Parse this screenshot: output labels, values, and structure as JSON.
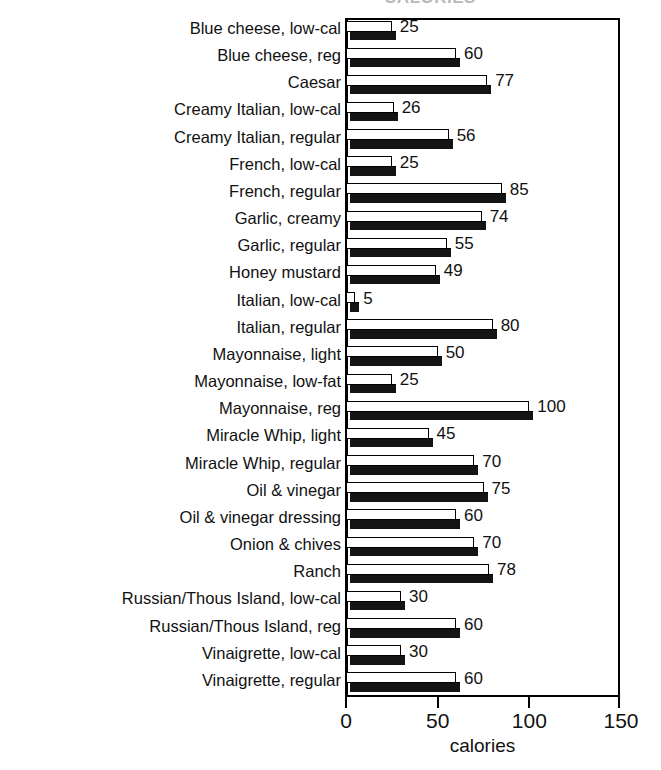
{
  "chart_data": {
    "type": "bar",
    "orientation": "horizontal",
    "title": "CALORIES",
    "subtitle": "",
    "xlabel": "calories",
    "ylabel": "",
    "xlim": [
      0,
      150
    ],
    "xticks": [
      0,
      50,
      100,
      150
    ],
    "xtick_labels": [
      "0",
      "50",
      "100",
      "150"
    ],
    "grid": false,
    "legend": null,
    "bar_style": "white-face-with-black-3d-shadow",
    "value_labels_shown": true,
    "categories": [
      "Blue cheese, low-cal",
      "Blue cheese, reg",
      "Caesar",
      "Creamy Italian, low-cal",
      "Creamy Italian, regular",
      "French, low-cal",
      "French, regular",
      "Garlic, creamy",
      "Garlic, regular",
      "Honey mustard",
      "Italian, low-cal",
      "Italian, regular",
      "Mayonnaise, light",
      "Mayonnaise, low-fat",
      "Mayonnaise, reg",
      "Miracle Whip, light",
      "Miracle Whip, regular",
      "Oil & vinegar",
      "Oil & vinegar dressing",
      "Onion & chives",
      "Ranch",
      "Russian/Thous Island, low-cal",
      "Russian/Thous Island, reg",
      "Vinaigrette, low-cal",
      "Vinaigrette, regular"
    ],
    "values": [
      25,
      60,
      77,
      26,
      56,
      25,
      85,
      74,
      55,
      49,
      5,
      80,
      50,
      25,
      100,
      45,
      70,
      75,
      60,
      70,
      78,
      30,
      60,
      30,
      60
    ],
    "value_label_texts": [
      "25",
      "60",
      "77",
      "26",
      "56",
      "25",
      "85",
      "74",
      "55",
      "49",
      "5",
      "80",
      "50",
      "25",
      "100",
      "45",
      "70",
      "75",
      "60",
      "70",
      "78",
      "30",
      "60",
      "30",
      "60"
    ],
    "colors": {
      "bar_face": "#ffffff",
      "bar_outline": "#000000",
      "bar_shadow": "#141414",
      "axis": "#000000",
      "text": "#111111",
      "background": "#ffffff"
    }
  }
}
